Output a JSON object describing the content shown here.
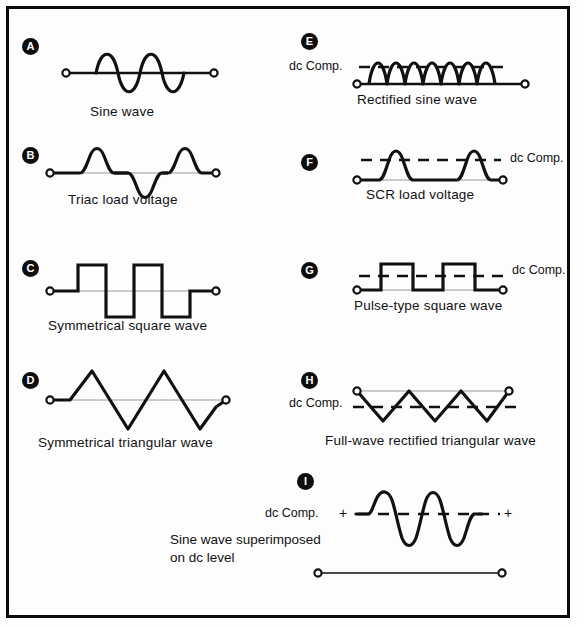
{
  "figure": {
    "border_color": "#0a0a0a",
    "background": "#fdfdfd",
    "stroke_color": "#111111",
    "baseline_color": "#9a9a9a"
  },
  "panels": [
    {
      "id": "A",
      "badge": "A",
      "caption": "Sine wave",
      "dc_label": null,
      "waveform": "sine-wave"
    },
    {
      "id": "B",
      "badge": "B",
      "caption": "Triac load voltage",
      "dc_label": null,
      "waveform": "triac-load-voltage"
    },
    {
      "id": "C",
      "badge": "C",
      "caption": "Symmetrical square wave",
      "dc_label": null,
      "waveform": "symmetrical-square-wave"
    },
    {
      "id": "D",
      "badge": "D",
      "caption": "Symmetrical triangular wave",
      "dc_label": null,
      "waveform": "symmetrical-triangular-wave"
    },
    {
      "id": "E",
      "badge": "E",
      "caption": "Rectified sine wave",
      "dc_label": "dc Comp.",
      "dc_label_side": "left",
      "waveform": "rectified-sine-wave"
    },
    {
      "id": "F",
      "badge": "F",
      "caption": "SCR load voltage",
      "dc_label": "dc Comp.",
      "dc_label_side": "right",
      "waveform": "scr-load-voltage"
    },
    {
      "id": "G",
      "badge": "G",
      "caption": "Pulse-type square wave",
      "dc_label": "dc Comp.",
      "dc_label_side": "right",
      "waveform": "pulse-type-square-wave"
    },
    {
      "id": "H",
      "badge": "H",
      "caption": "Full-wave rectified triangular wave",
      "dc_label": "dc Comp.",
      "dc_label_side": "left",
      "waveform": "full-wave-rectified-triangular-wave"
    },
    {
      "id": "I",
      "badge": "I",
      "caption_line1": "Sine wave superimposed",
      "caption_line2": "on dc level",
      "dc_label": "dc Comp.",
      "dc_label_side": "left",
      "plus_left": "+",
      "plus_right": "+",
      "waveform": "sine-wave-superimposed-on-dc-level"
    }
  ]
}
